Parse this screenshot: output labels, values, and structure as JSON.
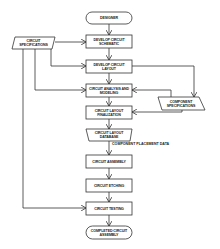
{
  "diagram": {
    "type": "flowchart",
    "nodes": {
      "designer": {
        "label": "DESIGNER",
        "shape": "terminal"
      },
      "circuit_specs": {
        "label": "CIRCUIT SPECIFICATIONS",
        "shape": "data"
      },
      "develop_schematic": {
        "label": "DEVELOP CIRCUIT SCHEMATIC",
        "shape": "process"
      },
      "develop_layout": {
        "label": "DEVELOP CIRCUIT LAYOUT",
        "shape": "process"
      },
      "analysis_modeling": {
        "label": "CIRCUIT ANALYSIS AND MODELING",
        "shape": "process"
      },
      "component_specs": {
        "label": "COMPONENT SPECIFICATIONS",
        "shape": "data"
      },
      "layout_finalization": {
        "label": "CIRCUIT LAYOUT FINALIZATION",
        "shape": "process"
      },
      "layout_database": {
        "label": "CIRCUIT LAYOUT DATABASE",
        "shape": "data"
      },
      "circuit_assembly": {
        "label": "CIRCUIT ASSEMBLY",
        "shape": "process"
      },
      "circuit_etching": {
        "label": "CIRCUIT ETCHING",
        "shape": "process"
      },
      "circuit_testing": {
        "label": "CIRCUIT TESTING",
        "shape": "process"
      },
      "completed_assembly": {
        "label": "COMPLETED CIRCUIT ASSEMBLY",
        "shape": "terminal"
      }
    },
    "edge_labels": {
      "placement": "COMPONENT PLACEMENT DATA"
    },
    "edges": [
      {
        "from": "designer",
        "to": "develop_schematic"
      },
      {
        "from": "circuit_specs",
        "to": "develop_schematic"
      },
      {
        "from": "develop_schematic",
        "to": "develop_layout"
      },
      {
        "from": "circuit_specs",
        "to": "develop_layout"
      },
      {
        "from": "develop_layout",
        "to": "analysis_modeling"
      },
      {
        "from": "develop_layout",
        "to": "component_specs"
      },
      {
        "from": "circuit_specs",
        "to": "analysis_modeling"
      },
      {
        "from": "component_specs",
        "to": "analysis_modeling"
      },
      {
        "from": "analysis_modeling",
        "to": "layout_finalization"
      },
      {
        "from": "component_specs",
        "to": "layout_finalization"
      },
      {
        "from": "layout_finalization",
        "to": "layout_database"
      },
      {
        "from": "layout_database",
        "to": "circuit_assembly",
        "label": "COMPONENT PLACEMENT DATA"
      },
      {
        "from": "circuit_assembly",
        "to": "circuit_etching"
      },
      {
        "from": "circuit_etching",
        "to": "circuit_testing"
      },
      {
        "from": "circuit_specs",
        "to": "circuit_testing"
      },
      {
        "from": "circuit_testing",
        "to": "completed_assembly"
      }
    ]
  }
}
